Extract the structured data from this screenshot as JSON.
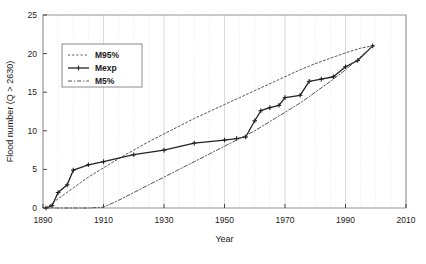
{
  "chart_data": {
    "type": "line",
    "title": "",
    "xlabel": "Year",
    "ylabel": "Flood number (Q > 2630)",
    "xlim": [
      1890,
      2010
    ],
    "ylim": [
      0,
      25
    ],
    "xticks": [
      1890,
      1910,
      1930,
      1950,
      1970,
      1990,
      2010
    ],
    "yticks": [
      0,
      5,
      10,
      15,
      20,
      25
    ],
    "xtick_labels": [
      "1890",
      "1910",
      "1930",
      "1950",
      "1970",
      "1990",
      "2010"
    ],
    "ytick_labels": [
      "0",
      "5",
      "10",
      "15",
      "20",
      "25"
    ],
    "grid": "vertical-minor-5yr",
    "legend_position": "upper-left-inside",
    "series": [
      {
        "name": "M95%",
        "style": "dotted",
        "color": "#555555",
        "points": [
          [
            1891,
            0.0
          ],
          [
            1895,
            1.2
          ],
          [
            1900,
            2.6
          ],
          [
            1905,
            4.0
          ],
          [
            1910,
            5.2
          ],
          [
            1915,
            6.4
          ],
          [
            1920,
            7.5
          ],
          [
            1925,
            8.6
          ],
          [
            1930,
            9.6
          ],
          [
            1935,
            10.6
          ],
          [
            1940,
            11.6
          ],
          [
            1945,
            12.5
          ],
          [
            1950,
            13.4
          ],
          [
            1955,
            14.3
          ],
          [
            1960,
            15.2
          ],
          [
            1965,
            16.1
          ],
          [
            1970,
            17.0
          ],
          [
            1975,
            17.9
          ],
          [
            1980,
            18.7
          ],
          [
            1985,
            19.4
          ],
          [
            1990,
            20.1
          ],
          [
            1995,
            20.7
          ],
          [
            1999,
            21.0
          ]
        ]
      },
      {
        "name": "Mexp",
        "style": "solid-markers",
        "color": "#222222",
        "points": [
          [
            1891,
            0.0
          ],
          [
            1893,
            0.3
          ],
          [
            1895,
            2.0
          ],
          [
            1898,
            3.0
          ],
          [
            1900,
            4.9
          ],
          [
            1905,
            5.6
          ],
          [
            1910,
            6.0
          ],
          [
            1920,
            6.9
          ],
          [
            1930,
            7.5
          ],
          [
            1940,
            8.4
          ],
          [
            1950,
            8.8
          ],
          [
            1954,
            9.0
          ],
          [
            1957,
            9.2
          ],
          [
            1960,
            11.3
          ],
          [
            1962,
            12.6
          ],
          [
            1965,
            13.0
          ],
          [
            1968,
            13.3
          ],
          [
            1970,
            14.3
          ],
          [
            1975,
            14.6
          ],
          [
            1978,
            16.4
          ],
          [
            1982,
            16.7
          ],
          [
            1986,
            17.0
          ],
          [
            1990,
            18.3
          ],
          [
            1994,
            19.1
          ],
          [
            1999,
            21.0
          ]
        ]
      },
      {
        "name": "M5%",
        "style": "dash-dot",
        "color": "#555555",
        "points": [
          [
            1891,
            0.0
          ],
          [
            1900,
            0.0
          ],
          [
            1905,
            0.0
          ],
          [
            1910,
            0.1
          ],
          [
            1915,
            1.0
          ],
          [
            1920,
            2.0
          ],
          [
            1925,
            3.0
          ],
          [
            1930,
            4.0
          ],
          [
            1935,
            5.0
          ],
          [
            1940,
            6.0
          ],
          [
            1945,
            7.0
          ],
          [
            1950,
            8.0
          ],
          [
            1955,
            9.0
          ],
          [
            1960,
            10.0
          ],
          [
            1965,
            11.2
          ],
          [
            1970,
            12.4
          ],
          [
            1975,
            13.6
          ],
          [
            1980,
            15.0
          ],
          [
            1985,
            16.4
          ],
          [
            1990,
            17.9
          ],
          [
            1995,
            19.6
          ],
          [
            1999,
            21.0
          ]
        ]
      }
    ],
    "legend_entries": [
      {
        "label": "M95%",
        "style": "dotted"
      },
      {
        "label": "Mexp",
        "style": "solid-markers"
      },
      {
        "label": "M5%",
        "style": "dash-dot"
      }
    ]
  }
}
